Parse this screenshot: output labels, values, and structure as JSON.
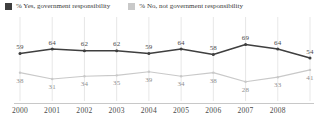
{
  "legend": {
    "position": "top-left",
    "entries": [
      {
        "label": "% Yes, government responsibility",
        "color": "#3f3f3f",
        "swatch_name": "legend-swatch-yes"
      },
      {
        "label": "% No, not government responsibility",
        "color": "#c9c9c9",
        "swatch_name": "legend-swatch-no"
      }
    ]
  },
  "chart_data": {
    "type": "line",
    "title": "",
    "subtitle": "",
    "xlabel": "",
    "ylabel": "",
    "grid": "vertical",
    "ylim": [
      20,
      75
    ],
    "categories": [
      "2000",
      "2001",
      "2002",
      "2003",
      "2004",
      "2005",
      "2006",
      "2007",
      "2008",
      ""
    ],
    "tick_labels": [
      "2000",
      "2001",
      "2002",
      "2003",
      "2004",
      "2005",
      "2006",
      "2007",
      "2008"
    ],
    "series": [
      {
        "name": "% Yes, government responsibility",
        "color": "#3f3f3f",
        "values": [
          59,
          64,
          62,
          62,
          59,
          64,
          58,
          69,
          64,
          54
        ],
        "labels": [
          "59",
          "64",
          "62",
          "62",
          "59",
          "64",
          "58",
          "69",
          "64",
          "54"
        ],
        "label_position": "above"
      },
      {
        "name": "% No, not government responsibility",
        "color": "#c9c9c9",
        "values": [
          38,
          31,
          34,
          35,
          39,
          34,
          38,
          28,
          33,
          41
        ],
        "labels": [
          "38",
          "31",
          "34",
          "35",
          "39",
          "34",
          "38",
          "28",
          "33",
          "41"
        ],
        "label_position": "below"
      }
    ]
  }
}
